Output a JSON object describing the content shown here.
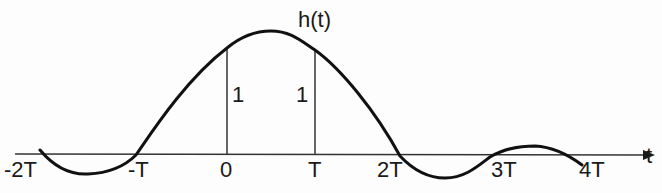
{
  "figure": {
    "function_label": "h(t)",
    "axis_label": "t",
    "tick_labels": [
      "-2T",
      "-T",
      "0",
      "T",
      "2T",
      "3T",
      "4T"
    ],
    "sample_values": [
      {
        "at": "0",
        "value": "1"
      },
      {
        "at": "T",
        "value": "1"
      }
    ],
    "colors": {
      "curve": "#1a1a1a",
      "axis": "#333333",
      "text": "#1a1a1a",
      "background": "#fdfdfd"
    }
  },
  "labels": {
    "h": "h(t)",
    "t": "t",
    "m2T": "-2T",
    "mT": "-T",
    "zero": "0",
    "T": "T",
    "twoT": "2T",
    "threeT": "3T",
    "fourT": "4T",
    "one_at_0": "1",
    "one_at_T": "1"
  }
}
